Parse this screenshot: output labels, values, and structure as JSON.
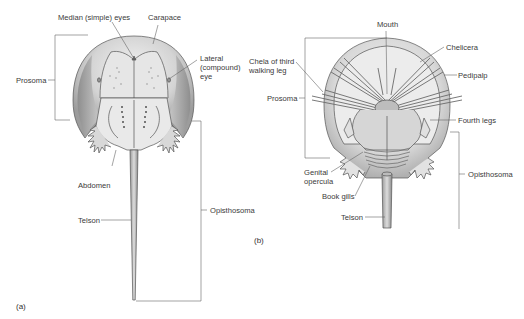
{
  "figure": {
    "panels": [
      {
        "id": "a",
        "tag": "(a)",
        "view": "dorsal",
        "labels": {
          "median_eyes": "Median (simple) eyes",
          "carapace": "Carapace",
          "lateral_eye": "Lateral\n(compound)\neye",
          "prosoma": "Prosoma",
          "abdomen": "Abdomen",
          "telson": "Telson",
          "opisthosoma": "Opisthosoma"
        }
      },
      {
        "id": "b",
        "tag": "(b)",
        "view": "ventral",
        "labels": {
          "mouth": "Mouth",
          "chelicera": "Chelicera",
          "chela": "Chela of third\nwalking leg",
          "pedipalp": "Pedipalp",
          "prosoma": "Prosoma",
          "fourth_legs": "Fourth legs",
          "genital_opercula": "Genital\nopercula",
          "book_gills": "Book gills",
          "opisthosoma": "Opisthosoma",
          "telson": "Telson"
        }
      }
    ]
  },
  "colors": {
    "line": "#555555",
    "shell_dark": "#9a9a9a",
    "shell_light": "#e4e4e4",
    "leader": "#666666"
  }
}
